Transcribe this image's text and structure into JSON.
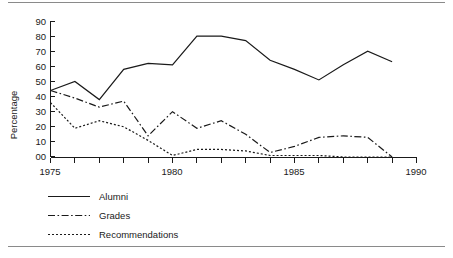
{
  "figure": {
    "rules": {
      "top": "horizontal-rule",
      "bottom": "horizontal-rule"
    }
  },
  "axes": {
    "ylabel": "Percentage",
    "ytick_labels": [
      "90",
      "80",
      "70",
      "60",
      "50",
      "40",
      "30",
      "20",
      "10",
      "00"
    ],
    "xtick_labels": [
      "1975",
      "1980",
      "1985",
      "1990"
    ]
  },
  "legend": {
    "items": [
      {
        "label": "Alumni",
        "style": "solid"
      },
      {
        "label": "Grades",
        "style": "dash-dot"
      },
      {
        "label": "Recommendations",
        "style": "dotted"
      }
    ]
  },
  "chart_data": {
    "type": "line",
    "title": "",
    "xlabel": "",
    "ylabel": "Percentage",
    "xlim": [
      1975,
      1990
    ],
    "ylim": [
      0,
      90
    ],
    "grid": false,
    "legend_position": "below-axes-left",
    "xtick_labels": [
      "1975",
      "1980",
      "1985",
      "1990"
    ],
    "ytick_labels": [
      "00",
      "10",
      "20",
      "30",
      "40",
      "50",
      "60",
      "70",
      "80",
      "90"
    ],
    "x": [
      1975,
      1976,
      1977,
      1978,
      1979,
      1980,
      1981,
      1982,
      1983,
      1984,
      1985,
      1986,
      1987,
      1988,
      1989
    ],
    "series": [
      {
        "name": "Alumni",
        "style": "solid",
        "color": "#1a1a1a",
        "values": [
          44,
          50,
          38,
          58,
          62,
          61,
          80,
          80,
          77,
          64,
          58,
          51,
          61,
          70,
          63
        ]
      },
      {
        "name": "Grades",
        "style": "dash-dot",
        "color": "#1a1a1a",
        "values": [
          44,
          39,
          33,
          37,
          14,
          30,
          19,
          24,
          15,
          3,
          7,
          13,
          14,
          13,
          0
        ]
      },
      {
        "name": "Recommendations",
        "style": "dotted",
        "color": "#1a1a1a",
        "values": [
          36,
          19,
          24,
          20,
          11,
          1,
          5,
          5,
          4,
          1,
          1,
          1,
          0,
          0,
          0
        ]
      }
    ]
  }
}
